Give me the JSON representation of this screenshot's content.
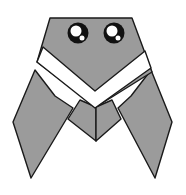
{
  "image": {
    "subject": "origami cicada illustration",
    "width": 186,
    "height": 195,
    "background": "#ffffff"
  },
  "colors": {
    "body_fill": "#9b9b9b",
    "outline": "#1a1a1a",
    "band_fill": "#ffffff",
    "eye_fill": "#111111",
    "eye_highlight": "#ffffff"
  },
  "parts": {
    "head": {
      "label": "head"
    },
    "band": {
      "label": "white V band"
    },
    "left_wing": {
      "label": "left wing"
    },
    "right_wing": {
      "label": "right wing"
    },
    "abdomen": {
      "label": "abdomen"
    },
    "left_eye": {
      "label": "left eye"
    },
    "right_eye": {
      "label": "right eye"
    }
  }
}
